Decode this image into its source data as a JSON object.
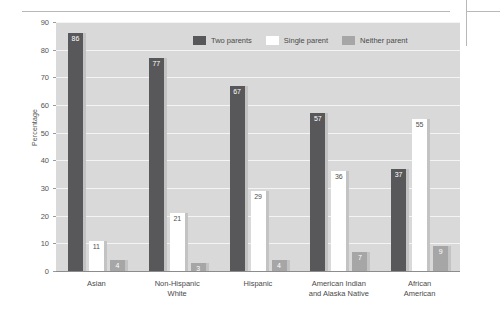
{
  "chart_data": {
    "type": "bar",
    "title": "",
    "subtitle": "",
    "xlabel": "",
    "ylabel": "Percentage",
    "ylim": [
      0,
      90
    ],
    "ytick_step": 10,
    "yticks": [
      "0",
      "10",
      "20",
      "30",
      "40",
      "50",
      "60",
      "70",
      "80",
      "90"
    ],
    "grid": true,
    "legend_position": "top-center",
    "categories": [
      "Asian",
      "Non-Hispanic White",
      "Hispanic",
      "American Indian and Alaska Native",
      "African American"
    ],
    "category_lines": [
      [
        "Asian"
      ],
      [
        "Non-Hispanic",
        "White"
      ],
      [
        "Hispanic"
      ],
      [
        "American Indian",
        "and Alaska Native"
      ],
      [
        "African",
        "American"
      ]
    ],
    "series": [
      {
        "name": "Two parents",
        "color": "#58585a",
        "values": [
          86,
          77,
          67,
          57,
          37
        ]
      },
      {
        "name": "Single parent",
        "color": "#ffffff",
        "values": [
          11,
          21,
          29,
          36,
          55
        ]
      },
      {
        "name": "Neither parent",
        "color": "#a6a6a6",
        "values": [
          4,
          3,
          4,
          7,
          9
        ]
      }
    ]
  },
  "colors": {
    "plot_background": "#d9d9d9",
    "gridline": "#f4f4f4",
    "axis": "#8c8c8c",
    "text": "#4a4a4a",
    "shadow": "#c3c3c3",
    "rule": "#b8b8b8"
  }
}
